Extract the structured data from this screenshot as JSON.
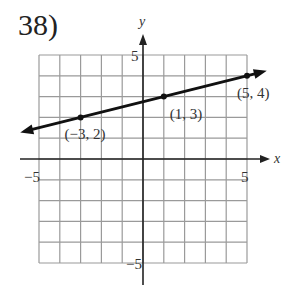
{
  "problem": {
    "number": "38)"
  },
  "chart_data": {
    "type": "line",
    "title": "",
    "xlabel": "x",
    "ylabel": "y",
    "xlim": [
      -5,
      5
    ],
    "ylim": [
      -5,
      5
    ],
    "grid": true,
    "tick_labels": {
      "x_min": "−5",
      "x_max": "5",
      "y_max": "5",
      "y_min": "−5"
    },
    "series": [
      {
        "name": "line",
        "points": [
          {
            "x": -3,
            "y": 2,
            "label": "(−3, 2)"
          },
          {
            "x": 1,
            "y": 3,
            "label": "(1, 3)"
          },
          {
            "x": 5,
            "y": 4,
            "label": "(5, 4)"
          }
        ],
        "slope": 0.25,
        "intercept": 2.75,
        "arrows_both_ends": true
      }
    ]
  }
}
